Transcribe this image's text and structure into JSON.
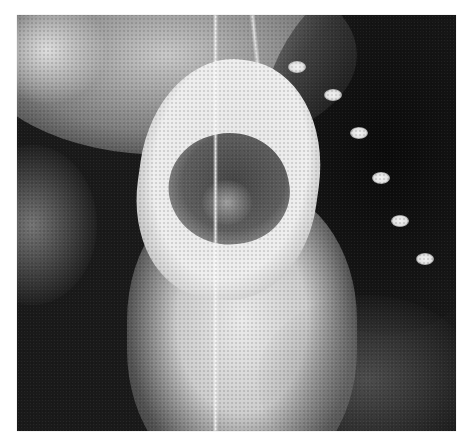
{
  "image": {
    "kind": "grayscale radiograph",
    "description": "Chest X-ray showing a large rounded opaque ring-shaped mass above the mediastinum with a darker center, a thin vertical tube, and rib-end bright spots on the right side",
    "background_color": "#ffffff",
    "bright_spots": [
      {
        "x": 280,
        "y": 52
      },
      {
        "x": 316,
        "y": 80
      },
      {
        "x": 342,
        "y": 118
      },
      {
        "x": 364,
        "y": 163
      },
      {
        "x": 383,
        "y": 206
      },
      {
        "x": 408,
        "y": 244
      }
    ]
  }
}
